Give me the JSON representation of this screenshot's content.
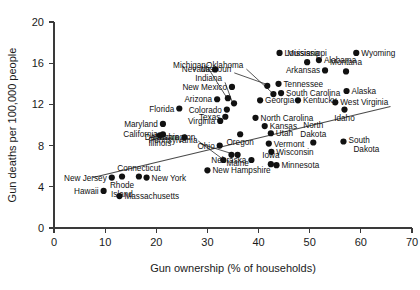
{
  "chart_data": {
    "type": "scatter",
    "title": "",
    "xlabel": "Gun ownership (% of households)",
    "ylabel": "Gun deaths per 100,000 people",
    "xlim": [
      0,
      70
    ],
    "ylim": [
      0,
      20
    ],
    "xticks": [
      0,
      10,
      20,
      30,
      40,
      50,
      60,
      70
    ],
    "yticks": [
      0,
      4,
      8,
      12,
      16,
      20
    ],
    "grid": false,
    "legend": "none",
    "trendline": {
      "x0": 7.6,
      "y0": 4.9,
      "x1": 65.8,
      "y1": 11.8
    },
    "points": [
      {
        "label": "Hawaii",
        "x": 9.7,
        "y": 3.6,
        "label_pos": "left"
      },
      {
        "label": "Massachusetts",
        "x": 12.8,
        "y": 3.1,
        "label_pos": "right"
      },
      {
        "label": "New Jersey",
        "x": 11.3,
        "y": 4.9,
        "label_pos": "left"
      },
      {
        "label": "Rhode Island",
        "x": 13.3,
        "y": 5.0,
        "label_pos": "below"
      },
      {
        "label": "Connecticut",
        "x": 16.6,
        "y": 5.0,
        "label_pos": "above"
      },
      {
        "label": "New York",
        "x": 18.1,
        "y": 4.9,
        "label_pos": "right"
      },
      {
        "label": "Illinois",
        "x": 20.7,
        "y": 9.0,
        "label_pos": "below"
      },
      {
        "label": "California",
        "x": 21.3,
        "y": 9.1,
        "label_pos": "left"
      },
      {
        "label": "Maryland",
        "x": 21.3,
        "y": 10.1,
        "label_pos": "left"
      },
      {
        "label": "Delaware",
        "x": 25.5,
        "y": 8.8,
        "label_pos": "left"
      },
      {
        "label": "Florida",
        "x": 24.5,
        "y": 11.6,
        "label_pos": "left"
      },
      {
        "label": "Ohio",
        "x": 32.4,
        "y": 8.0,
        "label_pos": "left"
      },
      {
        "label": "Pennsylvania",
        "x": 34.7,
        "y": 7.1,
        "label_pos": "leader"
      },
      {
        "label": "Washington",
        "x": 33.1,
        "y": 6.6,
        "label_pos": "leader"
      },
      {
        "label": "New Hampshire",
        "x": 30.0,
        "y": 5.6,
        "label_pos": "right"
      },
      {
        "label": "Nebraska",
        "x": 38.6,
        "y": 6.6,
        "label_pos": "left"
      },
      {
        "label": "Maine",
        "x": 35.9,
        "y": 7.1,
        "label_pos": "below"
      },
      {
        "label": "Oregon",
        "x": 36.4,
        "y": 9.1,
        "label_pos": "below"
      },
      {
        "label": "Iowa",
        "x": 42.4,
        "y": 6.2,
        "label_pos": "above"
      },
      {
        "label": "Minnesota",
        "x": 43.5,
        "y": 6.1,
        "label_pos": "right"
      },
      {
        "label": "Wisconsin",
        "x": 42.5,
        "y": 7.4,
        "label_pos": "right"
      },
      {
        "label": "Vermont",
        "x": 42.0,
        "y": 8.2,
        "label_pos": "right"
      },
      {
        "label": "Utah",
        "x": 42.4,
        "y": 9.2,
        "label_pos": "right"
      },
      {
        "label": "Kansas",
        "x": 41.2,
        "y": 9.9,
        "label_pos": "right"
      },
      {
        "label": "Virginia",
        "x": 32.5,
        "y": 10.4,
        "label_pos": "left"
      },
      {
        "label": "Texas",
        "x": 33.5,
        "y": 10.8,
        "label_pos": "left"
      },
      {
        "label": "Colorado",
        "x": 33.8,
        "y": 11.5,
        "label_pos": "left"
      },
      {
        "label": "Indiana",
        "x": 35.2,
        "y": 12.1,
        "label_pos": "leader"
      },
      {
        "label": "Michigan",
        "x": 34.0,
        "y": 12.6,
        "label_pos": "leader"
      },
      {
        "label": "Arizona",
        "x": 31.9,
        "y": 12.5,
        "label_pos": "left"
      },
      {
        "label": "North Carolina",
        "x": 39.4,
        "y": 10.7,
        "label_pos": "right"
      },
      {
        "label": "Georgia",
        "x": 40.3,
        "y": 12.4,
        "label_pos": "right"
      },
      {
        "label": "Kentucky",
        "x": 47.7,
        "y": 12.4,
        "label_pos": "right"
      },
      {
        "label": "New Mexico",
        "x": 34.8,
        "y": 13.7,
        "label_pos": "left"
      },
      {
        "label": "Nevada",
        "x": 31.5,
        "y": 15.4,
        "label_pos": "left"
      },
      {
        "label": "Missouri",
        "x": 41.7,
        "y": 13.8,
        "label_pos": "leader"
      },
      {
        "label": "Oklahoma",
        "x": 42.9,
        "y": 13.0,
        "label_pos": "leader"
      },
      {
        "label": "South Carolina",
        "x": 44.4,
        "y": 13.1,
        "label_pos": "right"
      },
      {
        "label": "Tennessee",
        "x": 43.9,
        "y": 14.0,
        "label_pos": "right"
      },
      {
        "label": "Louisiana",
        "x": 44.1,
        "y": 17.0,
        "label_pos": "right"
      },
      {
        "label": "Mississippi",
        "x": 49.5,
        "y": 16.1,
        "label_pos": "above"
      },
      {
        "label": "Arkansas",
        "x": 53.0,
        "y": 15.3,
        "label_pos": "left"
      },
      {
        "label": "Alabama",
        "x": 51.8,
        "y": 16.3,
        "label_pos": "right"
      },
      {
        "label": "Wyoming",
        "x": 59.1,
        "y": 17.0,
        "label_pos": "right"
      },
      {
        "label": "Montana",
        "x": 57.1,
        "y": 15.2,
        "label_pos": "above"
      },
      {
        "label": "Alaska",
        "x": 57.2,
        "y": 13.3,
        "label_pos": "right"
      },
      {
        "label": "West Virginia",
        "x": 55.0,
        "y": 12.2,
        "label_pos": "right"
      },
      {
        "label": "Idaho",
        "x": 56.8,
        "y": 11.5,
        "label_pos": "below"
      },
      {
        "label": "North Dakota",
        "x": 50.7,
        "y": 8.3,
        "label_pos": "above"
      },
      {
        "label": "South Dakota",
        "x": 56.6,
        "y": 8.4,
        "label_pos": "right"
      }
    ]
  },
  "axes": {
    "x_title": "Gun ownership (% of households)",
    "y_title": "Gun deaths per 100,000 people",
    "x_tick_labels": [
      "0",
      "10",
      "20",
      "30",
      "40",
      "50",
      "60",
      "70"
    ],
    "y_tick_labels": [
      "0",
      "4",
      "8",
      "12",
      "16",
      "20"
    ]
  },
  "style": {
    "point_color": "#111111",
    "axis_color": "#3a3a3a",
    "trend_color": "#4a4a4a",
    "background": "#ffffff"
  }
}
